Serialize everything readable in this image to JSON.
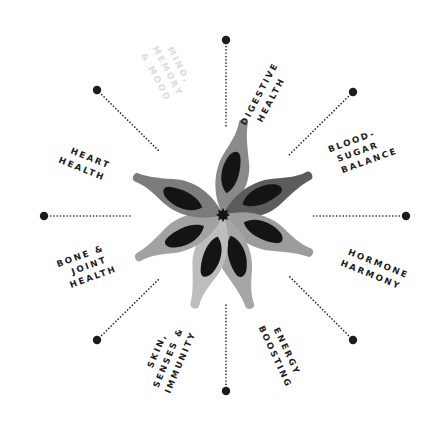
{
  "diagram": {
    "title": "",
    "center": {
      "x": 223,
      "y": 215
    },
    "colors": {
      "background": "#ffffff",
      "ink": "#1c1c1c",
      "faded": "#dcdcdc",
      "petal_inner": "#141414"
    },
    "segments": [
      {
        "id": "digestive-health",
        "lines": [
          "DIGESTIVE",
          "HEALTH"
        ],
        "faded": false
      },
      {
        "id": "blood-sugar-balance",
        "lines": [
          "BLOOD-",
          "SUGAR",
          "BALANCE"
        ],
        "faded": false
      },
      {
        "id": "hormone-harmony",
        "lines": [
          "HORMONE",
          "HARMONY"
        ],
        "faded": false
      },
      {
        "id": "energy-boosting",
        "lines": [
          "ENERGY",
          "BOOSTING"
        ],
        "faded": false
      },
      {
        "id": "skin-senses-immunity",
        "lines": [
          "SKIN,",
          "SENSES &",
          "IMMUNITY"
        ],
        "faded": false
      },
      {
        "id": "bone-joint-health",
        "lines": [
          "BONE &",
          "JOINT",
          "HEALTH"
        ],
        "faded": false
      },
      {
        "id": "heart-health",
        "lines": [
          "HEART",
          "HEALTH"
        ],
        "faded": false
      },
      {
        "id": "mind-memory-mood",
        "lines": [
          "MIND,",
          "MEMORY",
          "& MOOD"
        ],
        "faded": true
      }
    ],
    "spokes": [
      {
        "name": "spoke-top",
        "x1": 226,
        "y1": 40,
        "x2": 226,
        "y2": 126
      },
      {
        "name": "spoke-top-right",
        "x1": 353,
        "y1": 92,
        "x2": 289,
        "y2": 155
      },
      {
        "name": "spoke-right",
        "x1": 406,
        "y1": 216,
        "x2": 311,
        "y2": 216
      },
      {
        "name": "spoke-bottom-right",
        "x1": 353,
        "y1": 340,
        "x2": 289,
        "y2": 276
      },
      {
        "name": "spoke-bottom",
        "x1": 226,
        "y1": 391,
        "x2": 226,
        "y2": 303
      },
      {
        "name": "spoke-bottom-left",
        "x1": 97,
        "y1": 340,
        "x2": 160,
        "y2": 278
      },
      {
        "name": "spoke-left",
        "x1": 44,
        "y1": 216,
        "x2": 130,
        "y2": 216
      },
      {
        "name": "spoke-top-left",
        "x1": 97,
        "y1": 90,
        "x2": 160,
        "y2": 152
      }
    ],
    "petals": [
      {
        "name": "petal-top",
        "angle": -76,
        "color": "#8a8a8a"
      },
      {
        "name": "petal-right-upper",
        "angle": -23,
        "color": "#5c5c5c"
      },
      {
        "name": "petal-right-lower",
        "angle": 25,
        "color": "#9c9c9c"
      },
      {
        "name": "petal-bottom-right",
        "angle": 75,
        "color": "#a6a6a6"
      },
      {
        "name": "petal-bottom-left",
        "angle": 109,
        "color": "#bdbdbd"
      },
      {
        "name": "petal-left-lower",
        "angle": 155,
        "color": "#a2a2a2"
      },
      {
        "name": "petal-left-upper",
        "angle": 205,
        "color": "#7c7c7c"
      }
    ]
  }
}
